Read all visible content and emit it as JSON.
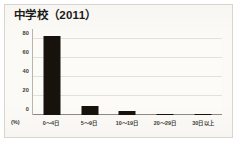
{
  "chart_data": {
    "type": "bar",
    "title": "中学校（2011）",
    "xlabel": "",
    "ylabel": "(%)",
    "categories": [
      "0〜4日",
      "5〜9日",
      "10〜19日",
      "20〜29日",
      "30日以上"
    ],
    "values": [
      83,
      9,
      4,
      1.5,
      1.5
    ],
    "ylim": [
      0,
      90
    ],
    "yticks": [
      "80",
      "60",
      "40",
      "20",
      "0"
    ],
    "ytick_values": [
      80,
      60,
      40,
      20,
      0
    ],
    "grid": true,
    "legend": "none",
    "series": [
      {
        "name": "中学校（2011）",
        "values": [
          83,
          9,
          4,
          1.5,
          1.5
        ]
      }
    ],
    "colors": {
      "bar": "#17120c",
      "grid": "#e4e1d6",
      "axis": "#8f8b81",
      "text": "#3b3b36",
      "title": "#1b1b18",
      "plot_background": "#fcfbf7",
      "page_background": "#fbfaf6",
      "frame_border": "#d8d5cc"
    }
  }
}
